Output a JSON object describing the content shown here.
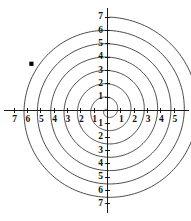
{
  "figure": {
    "background_color": "#ffffff",
    "line_color": "#2b2b2b",
    "axis_color": "#1a1a1a",
    "marker_color": "#000000"
  },
  "chart_data": {
    "type": "line",
    "title": "",
    "subtitle": "",
    "xlabel": "",
    "ylabel": "",
    "grid": false,
    "legend": null,
    "curve_name": "Archimedean spiral",
    "equation": "r = theta",
    "x_axis": {
      "tick_labels_left": [
        "7",
        "6",
        "5",
        "4",
        "3",
        "2",
        "1"
      ],
      "tick_labels_right": [
        "1",
        "2",
        "3",
        "4",
        "5"
      ],
      "tick_values_left": [
        -7,
        -6,
        -5,
        -4,
        -3,
        -2,
        -1
      ],
      "tick_values_right": [
        1,
        2,
        3,
        4,
        5
      ],
      "xlim": [
        -7.6,
        5.6
      ]
    },
    "y_axis": {
      "tick_labels_up": [
        "1",
        "2",
        "3",
        "4",
        "5",
        "6",
        "7"
      ],
      "tick_labels_down": [
        "1",
        "2",
        "3",
        "4",
        "5",
        "6",
        "7"
      ],
      "tick_values_up": [
        1,
        2,
        3,
        4,
        5,
        6,
        7
      ],
      "tick_values_down": [
        -1,
        -2,
        -3,
        -4,
        -5,
        -6,
        -7
      ],
      "ylim": [
        -7.6,
        7.6
      ]
    },
    "origin_label": "",
    "turns": 7,
    "annotations": [
      {
        "name": "point-marker",
        "shape": "square",
        "x": -5.7,
        "y": 3.5,
        "label": ""
      }
    ]
  }
}
